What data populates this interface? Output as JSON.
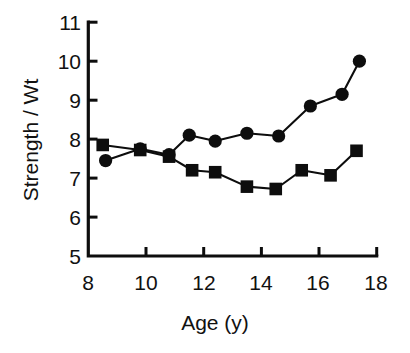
{
  "chart_data": {
    "type": "line",
    "title": "",
    "xlabel": "Age (y)",
    "ylabel": "Strength / Wt",
    "xlim": [
      8,
      18
    ],
    "ylim": [
      5,
      11
    ],
    "xticks": [
      8,
      10,
      12,
      14,
      16,
      18
    ],
    "yticks": [
      5,
      6,
      7,
      8,
      9,
      10,
      11
    ],
    "xtick_labels": [
      "8",
      "10",
      "12",
      "14",
      "16",
      "18"
    ],
    "ytick_labels": [
      "5",
      "6",
      "7",
      "8",
      "9",
      "10",
      "11"
    ],
    "grid": false,
    "legend": null,
    "legend_position": "none",
    "series": [
      {
        "name": "circle-series",
        "marker": "circle",
        "color": "#0d0d0d",
        "x": [
          8.6,
          9.8,
          10.8,
          11.5,
          12.4,
          13.5,
          14.6,
          15.7,
          16.8,
          17.4
        ],
        "y": [
          7.45,
          7.75,
          7.6,
          8.1,
          7.95,
          8.15,
          8.08,
          8.85,
          9.15,
          10.0
        ]
      },
      {
        "name": "square-series",
        "marker": "square",
        "color": "#0d0d0d",
        "x": [
          8.5,
          9.8,
          10.8,
          11.6,
          12.4,
          13.5,
          14.5,
          15.4,
          16.4,
          17.3
        ],
        "y": [
          7.85,
          7.72,
          7.55,
          7.2,
          7.15,
          6.78,
          6.72,
          7.2,
          7.07,
          7.7
        ]
      }
    ]
  },
  "axes": {
    "y_axis_title": "Strength / Wt",
    "x_axis_title": "Age (y)"
  }
}
